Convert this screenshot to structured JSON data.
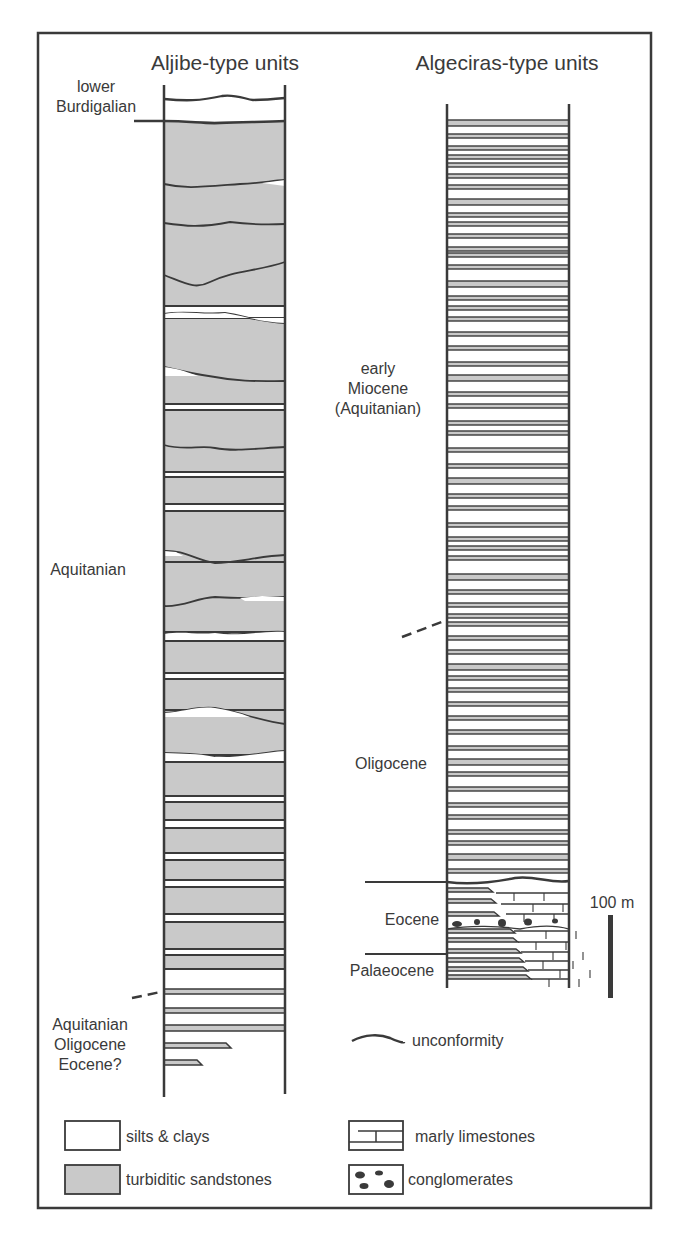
{
  "colors": {
    "sand": "#c9c9c9",
    "line": "#3a3a3a",
    "paper": "#ffffff",
    "text": "#3a3a3a"
  },
  "columns": {
    "aljibe": {
      "title": "Aljibe-type units",
      "age_labels": {
        "top": [
          "lower",
          "Burdigalian"
        ],
        "middle": "Aquitanian",
        "bottom": [
          "Aquitanian",
          "Oligocene",
          "Eocene?"
        ]
      }
    },
    "algeciras": {
      "title": "Algeciras-type units",
      "age_labels": {
        "miocene": [
          "early",
          "Miocene",
          "(Aquitanian)"
        ],
        "oligocene": "Oligocene",
        "eocene": "Eocene",
        "palaeocene": "Palaeocene"
      }
    }
  },
  "scale_bar": {
    "label": "100 m",
    "value_m": 100
  },
  "legend": {
    "unconformity": "unconformity",
    "items": [
      {
        "key": "silts",
        "label": "silts & clays"
      },
      {
        "key": "sand",
        "label": "turbiditic sandstones"
      },
      {
        "key": "marly",
        "label": "marly limestones"
      },
      {
        "key": "congl",
        "label": "conglomerates"
      }
    ]
  }
}
